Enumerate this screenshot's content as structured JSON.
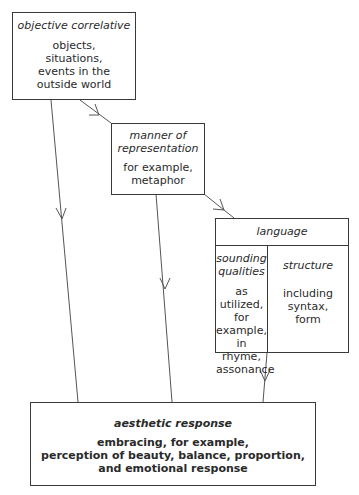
{
  "diagram": {
    "nodes": {
      "objective_correlative": {
        "title": "objective correlative",
        "body": "objects,\nsituations,\nevents in the\noutside world"
      },
      "manner_of_representation": {
        "title": "manner of\nrepresentation",
        "body": "for example,\nmetaphor"
      },
      "language": {
        "title": "language",
        "columns": [
          {
            "title": "sounding\nqualities",
            "body": "as utilized,\nfor example,\nin rhyme,\nassonance"
          },
          {
            "title": "structure",
            "body": "including\nsyntax,\nform"
          }
        ]
      },
      "aesthetic_response": {
        "title": "aesthetic response",
        "body": "embracing, for example,\nperception of beauty, balance, proportion,\nand emotional response"
      }
    },
    "edges": [
      {
        "from": "objective correlative",
        "to": "manner of representation"
      },
      {
        "from": "manner of representation",
        "to": "language"
      },
      {
        "from": "objective correlative",
        "to": "aesthetic response"
      },
      {
        "from": "manner of representation",
        "to": "aesthetic response"
      },
      {
        "from": "language",
        "to": "aesthetic response"
      }
    ]
  }
}
